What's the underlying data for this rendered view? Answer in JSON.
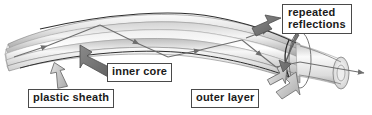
{
  "diagram": {
    "labels": {
      "plastic_sheath": "plastic sheath",
      "inner_core": "inner core",
      "outer_layer": "outer layer",
      "repeated_reflections_line1": "repeated",
      "repeated_reflections_line2": "reflections"
    },
    "colors": {
      "label_border": "#4a4a4a",
      "label_text": "#1a1a1a",
      "label_background": "#ffffff",
      "cable_outline": "#3d3d3d",
      "cable_light": "#f2f2f2",
      "cable_mid": "#c9c9c9",
      "cable_dark": "#8f8f8f",
      "ray": "#6e6e6e",
      "pointer_light": "#c0c0c0",
      "pointer_dark": "#707070"
    }
  }
}
